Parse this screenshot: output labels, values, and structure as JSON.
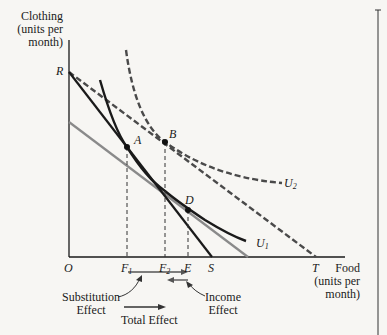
{
  "diagram": {
    "y_axis_label": [
      "Clothing",
      "(units per",
      "month)"
    ],
    "x_axis_label": [
      "Food",
      "(units per",
      "month)"
    ],
    "origin_label": "O",
    "y_intercept_label": "R",
    "points": {
      "A": "A",
      "B": "B",
      "D": "D"
    },
    "x_ticks": {
      "F1": "F",
      "F1_sub": "1",
      "F2": "F",
      "F2_sub": "2",
      "E": "E",
      "S": "S",
      "T": "T"
    },
    "curves": {
      "U1": "U",
      "U1_sub": "1",
      "U2": "U",
      "U2_sub": "2"
    },
    "effects": {
      "substitution": [
        "Substitution",
        "Effect"
      ],
      "income": [
        "Income",
        "Effect"
      ],
      "total": "Total Effect"
    },
    "colors": {
      "line": "#1a1a1a",
      "gray_line": "#8a8a8a",
      "dashed_budget": "#4a4a4a",
      "background": "#f7f6f3"
    }
  }
}
